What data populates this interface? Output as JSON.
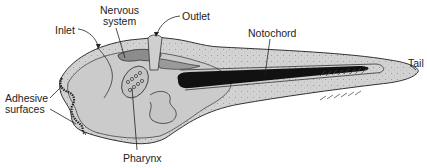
{
  "figure": {
    "labels": {
      "nervous_system_line1": "Nervous",
      "nervous_system_line2": "system",
      "outlet": "Outlet",
      "inlet": "Inlet",
      "notochord": "Notochord",
      "tail": "Tail",
      "adhesive_line1": "Adhesive",
      "adhesive_line2": "surfaces",
      "pharynx": "Pharynx"
    },
    "colors": {
      "body_fill": "#cfcfcf",
      "outline": "#333333",
      "notochord": "#111111",
      "inner_organ": "#b5b5b5",
      "dark_organ": "#888888"
    }
  }
}
